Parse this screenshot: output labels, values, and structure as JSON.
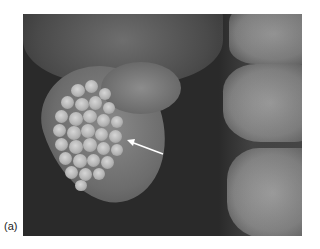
{
  "figure": {
    "label": "(a)",
    "annotation": {
      "type": "arrow",
      "color": "#ffffff"
    }
  }
}
